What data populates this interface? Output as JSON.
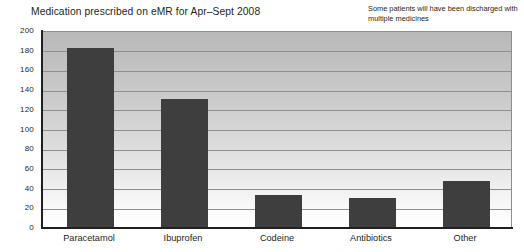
{
  "chart_data": {
    "type": "bar",
    "title": "Medication prescribed on eMR for Apr–Sept 2008",
    "annotation": "Some patients will have been discharged with multiple medicines",
    "xlabel": "",
    "ylabel": "",
    "categories": [
      "Paracetamol",
      "Ibuprofen",
      "Codeine",
      "Antibiotics",
      "Other"
    ],
    "values": [
      182,
      130,
      33,
      29,
      47
    ],
    "ylim": [
      0,
      200
    ],
    "ytick_labels": [
      "200",
      "180",
      "160",
      "140",
      "120",
      "100",
      "80",
      "60",
      "40",
      "20",
      "0"
    ],
    "ytick_values": [
      200,
      180,
      160,
      140,
      120,
      100,
      80,
      60,
      40,
      20,
      0
    ],
    "grid": true,
    "legend": false,
    "colors": {
      "bar": "#3e3e3e",
      "axis": "#231f20",
      "gridline": "#8f8f8f",
      "plot_top": "#b9b9b9",
      "plot_bottom": "#ffffff",
      "text": "#231f20"
    }
  }
}
